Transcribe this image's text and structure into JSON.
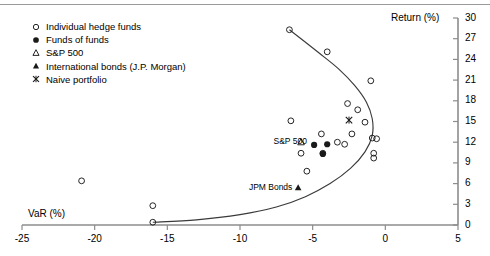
{
  "chart_data": {
    "type": "scatter",
    "title": "",
    "subtitle": "",
    "xlabel": "VaR (%)",
    "ylabel": "Return (%)",
    "xlim": [
      -25,
      5
    ],
    "ylim": [
      0,
      30
    ],
    "xticks": [
      -25,
      -20,
      -15,
      -10,
      -5,
      0,
      5
    ],
    "xticklabels": [
      "-25",
      "-20",
      "-15",
      "-10",
      "-5",
      "0",
      "5"
    ],
    "yticks": [
      0,
      3,
      6,
      9,
      12,
      15,
      18,
      21,
      24,
      27,
      30
    ],
    "yticklabels": [
      "0",
      "3",
      "6",
      "9",
      "12",
      "15",
      "18",
      "21",
      "24",
      "27",
      "30"
    ],
    "grid": false,
    "legend_position": "top-left",
    "y_axis_side": "right",
    "legend": [
      {
        "label": "Individual hedge funds",
        "marker": "open-circle"
      },
      {
        "label": "Funds of funds",
        "marker": "filled-circle"
      },
      {
        "label": "S&P 500",
        "marker": "open-triangle"
      },
      {
        "label": "International bonds (J.P. Morgan)",
        "marker": "filled-triangle"
      },
      {
        "label": "Naive portfolio",
        "marker": "cross-x"
      }
    ],
    "series": [
      {
        "name": "Individual hedge funds",
        "marker": "open-circle",
        "points": [
          {
            "x": -16.0,
            "y": 0.4
          },
          {
            "x": -16.0,
            "y": 2.8
          },
          {
            "x": -20.9,
            "y": 6.4
          },
          {
            "x": -6.6,
            "y": 28.3
          },
          {
            "x": -4.0,
            "y": 25.1
          },
          {
            "x": -1.0,
            "y": 20.9
          },
          {
            "x": -2.6,
            "y": 17.6
          },
          {
            "x": -1.9,
            "y": 16.7
          },
          {
            "x": -1.4,
            "y": 14.9
          },
          {
            "x": -6.5,
            "y": 15.1
          },
          {
            "x": -2.3,
            "y": 13.2
          },
          {
            "x": -0.9,
            "y": 12.6
          },
          {
            "x": -0.6,
            "y": 12.5
          },
          {
            "x": -4.4,
            "y": 13.2
          },
          {
            "x": -3.3,
            "y": 12.0
          },
          {
            "x": -2.8,
            "y": 11.7
          },
          {
            "x": -0.8,
            "y": 10.4
          },
          {
            "x": -0.8,
            "y": 9.7
          },
          {
            "x": -5.8,
            "y": 10.4
          },
          {
            "x": -4.3,
            "y": 10.4
          },
          {
            "x": -5.4,
            "y": 7.8
          }
        ]
      },
      {
        "name": "Funds of funds",
        "marker": "filled-circle",
        "points": [
          {
            "x": -4.9,
            "y": 11.6
          },
          {
            "x": -4.0,
            "y": 11.7
          },
          {
            "x": -4.3,
            "y": 10.3
          }
        ]
      },
      {
        "name": "S&P 500",
        "marker": "open-triangle",
        "points": [
          {
            "x": -5.8,
            "y": 12.0
          }
        ],
        "annotation": "S&P 500"
      },
      {
        "name": "International bonds (J.P. Morgan)",
        "marker": "filled-triangle",
        "points": [
          {
            "x": -6.0,
            "y": 5.4
          }
        ],
        "annotation": "JPM Bonds"
      },
      {
        "name": "Naive portfolio",
        "marker": "cross-x",
        "points": [
          {
            "x": -2.5,
            "y": 15.2
          }
        ]
      }
    ],
    "frontier_curve": {
      "name": "efficient frontier",
      "description": "mean-VaR efficient frontier arc",
      "points": [
        {
          "x": -16.0,
          "y": 0.4
        },
        {
          "x": -13.0,
          "y": 0.75
        },
        {
          "x": -10.0,
          "y": 1.5
        },
        {
          "x": -7.5,
          "y": 2.6
        },
        {
          "x": -5.5,
          "y": 4.1
        },
        {
          "x": -3.8,
          "y": 6.0
        },
        {
          "x": -2.4,
          "y": 8.2
        },
        {
          "x": -1.4,
          "y": 10.6
        },
        {
          "x": -0.9,
          "y": 13.0
        },
        {
          "x": -0.9,
          "y": 15.4
        },
        {
          "x": -1.3,
          "y": 17.8
        },
        {
          "x": -2.1,
          "y": 20.2
        },
        {
          "x": -3.2,
          "y": 22.6
        },
        {
          "x": -4.6,
          "y": 25.0
        },
        {
          "x": -6.6,
          "y": 28.3
        }
      ]
    },
    "annotations": [
      {
        "text": "S&P 500",
        "x": -7.6,
        "y": 12.0
      },
      {
        "text": "JPM Bonds",
        "x": -8.6,
        "y": 5.3
      }
    ],
    "colors": {
      "axis": "#8c8c8c",
      "marker": "#1a1a1a",
      "curve": "#3a3a3a",
      "text": "#000000",
      "background": "#ffffff"
    }
  }
}
